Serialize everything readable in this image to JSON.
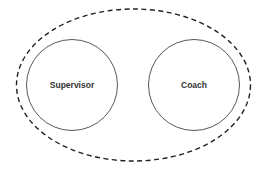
{
  "diagram": {
    "type": "containment-diagram",
    "container": {
      "label": "",
      "style": "dashed"
    },
    "nodes": [
      {
        "id": "supervisor",
        "label": "Supervisor"
      },
      {
        "id": "coach",
        "label": "Coach"
      }
    ],
    "colors": {
      "stroke": "#333333",
      "outer_stroke": "#222222",
      "background": "#ffffff"
    }
  }
}
